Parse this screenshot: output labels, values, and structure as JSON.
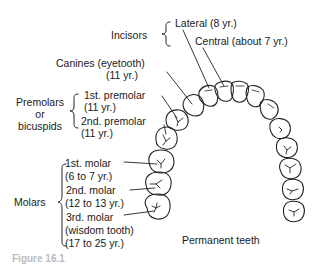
{
  "diagram": {
    "title": "Permanent teeth",
    "caption_fragment": "Figure 16.1",
    "colors": {
      "line": "#222222",
      "background": "#ffffff",
      "caption": "#bbbbbb"
    },
    "groups": {
      "incisors": "Incisors",
      "premolars": [
        "Premolars",
        "or",
        "bicuspids"
      ],
      "molars": "Molars"
    },
    "labels": {
      "lateral": "Lateral (8 yr.)",
      "central": "Central (about 7 yr.)",
      "canine_name": "Canines (eyetooth)",
      "canine_age": "(11 yr.)",
      "premolar1_name": "1st. premolar",
      "premolar1_age": "(11 yr.)",
      "premolar2_name": "2nd. premolar",
      "premolar2_age": "(11 yr.)",
      "molar1_name": "1st. molar",
      "molar1_age": "(6 to 7 yr.)",
      "molar2_name": "2nd. molar",
      "molar2_age": "(12 to 13 yr.)",
      "molar3_name": "3rd. molar",
      "molar3_note": "(wisdom tooth)",
      "molar3_age": "(17 to 25 yr.)"
    }
  }
}
